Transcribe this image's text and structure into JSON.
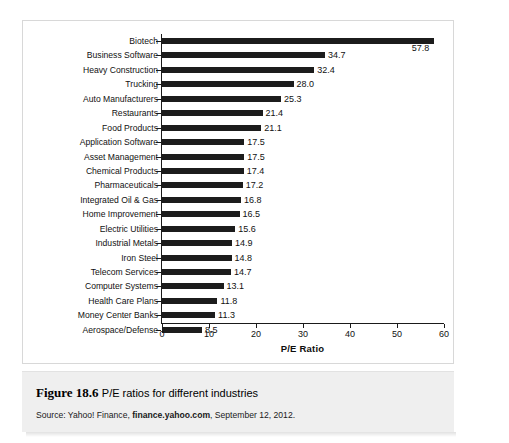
{
  "figure": {
    "number": "Figure 18.6",
    "title": "P/E ratios for different industries",
    "source_prefix": "Source: Yahoo! Finance, ",
    "source_strong": "finance.yahoo.com",
    "source_suffix": ", September 12, 2012."
  },
  "chart_data": {
    "type": "bar",
    "orientation": "horizontal",
    "title": "",
    "xlabel": "P/E Ratio",
    "ylabel": "",
    "xlim": [
      0,
      60
    ],
    "xticks": [
      0,
      10,
      20,
      30,
      40,
      50,
      60
    ],
    "grid": false,
    "legend": false,
    "bar_color": "#1c1c1c",
    "categories": [
      "Biotech",
      "Business Software",
      "Heavy Construction",
      "Trucking",
      "Auto Manufacturers",
      "Restaurants",
      "Food Products",
      "Application Software",
      "Asset Management",
      "Chemical Products",
      "Pharmaceuticals",
      "Integrated Oil & Gas",
      "Home Improvement",
      "Electric Utilities",
      "Industrial Metals",
      "Iron Steel",
      "Telecom Services",
      "Computer Systems",
      "Health Care Plans",
      "Money Center Banks",
      "Aerospace/Defense"
    ],
    "values": [
      57.8,
      34.7,
      32.4,
      28.0,
      25.3,
      21.4,
      21.1,
      17.5,
      17.5,
      17.4,
      17.2,
      16.8,
      16.5,
      15.6,
      14.9,
      14.8,
      14.7,
      13.1,
      11.8,
      11.3,
      8.5
    ],
    "value_labels": [
      "57.8",
      "34.7",
      "32.4",
      "28.0",
      "25.3",
      "21.4",
      "21.1",
      "17.5",
      "17.5",
      "17.4",
      "17.2",
      "16.8",
      "16.5",
      "15.6",
      "14.9",
      "14.8",
      "14.7",
      "13.1",
      "11.8",
      "11.3",
      "8.5"
    ]
  }
}
